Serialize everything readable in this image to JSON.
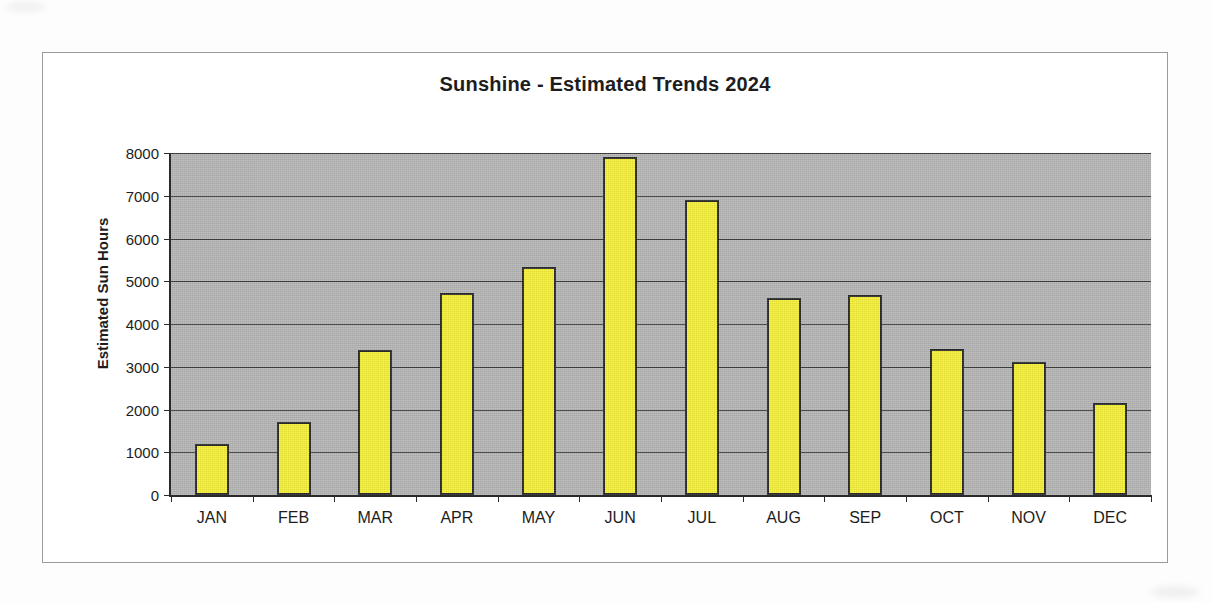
{
  "chart_data": {
    "type": "bar",
    "title": "Sunshine - Estimated Trends 2024",
    "xlabel": "",
    "ylabel": "Estimated Sun Hours",
    "categories": [
      "JAN",
      "FEB",
      "MAR",
      "APR",
      "MAY",
      "JUN",
      "JUL",
      "AUG",
      "SEP",
      "OCT",
      "NOV",
      "DEC"
    ],
    "values": [
      1200,
      1700,
      3400,
      4720,
      5340,
      7900,
      6910,
      4600,
      4670,
      3420,
      3120,
      2160
    ],
    "ylim": [
      0,
      8000
    ],
    "ytick_labels": [
      "8000",
      "7000",
      "6000",
      "5000",
      "4000",
      "3000",
      "2000",
      "1000",
      "0"
    ],
    "ytick_values": [
      8000,
      7000,
      6000,
      5000,
      4000,
      3000,
      2000,
      1000,
      0
    ],
    "grid": true,
    "legend": false,
    "legend_position": "none",
    "series": [
      {
        "name": "Estimated Sun Hours",
        "values": [
          1200,
          1700,
          3400,
          4720,
          5340,
          7900,
          6910,
          4600,
          4670,
          3420,
          3120,
          2160
        ]
      }
    ]
  },
  "colors": {
    "bar_fill": "#f4ef37",
    "bar_outline": "#262626",
    "plot_background": "#b3b3b3",
    "gridline": "#3a3a3a",
    "axis": "#2a2a2a",
    "text": "#1d1d1d",
    "page_background": "#fdfdfd",
    "frame_border": "#9a9a9a"
  }
}
